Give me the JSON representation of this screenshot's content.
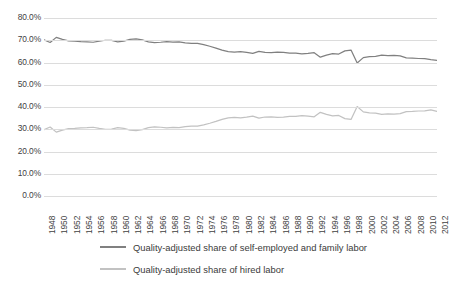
{
  "chart_data": {
    "type": "line",
    "title": "",
    "subtitle": "",
    "xlabel": "",
    "ylabel": "",
    "ylim": [
      0,
      0.8
    ],
    "ytick_labels": [
      "80.0%",
      "70.0%",
      "60.0%",
      "50.0%",
      "40.0%",
      "30.0%",
      "20.0%",
      "10.0%",
      "0.0%"
    ],
    "ytick_values": [
      80,
      70,
      60,
      50,
      40,
      30,
      20,
      10,
      0
    ],
    "grid": true,
    "legend_position": "bottom",
    "x": [
      1948,
      1949,
      1950,
      1951,
      1952,
      1953,
      1954,
      1955,
      1956,
      1957,
      1958,
      1959,
      1960,
      1961,
      1962,
      1963,
      1964,
      1965,
      1966,
      1967,
      1968,
      1969,
      1970,
      1971,
      1972,
      1973,
      1974,
      1975,
      1976,
      1977,
      1978,
      1979,
      1980,
      1981,
      1982,
      1983,
      1984,
      1985,
      1986,
      1987,
      1988,
      1989,
      1990,
      1991,
      1992,
      1993,
      1994,
      1995,
      1996,
      1997,
      1998,
      1999,
      2000,
      2001,
      2002,
      2003,
      2004,
      2005,
      2006,
      2007,
      2008,
      2009,
      2010,
      2011,
      2012
    ],
    "xtick_labels": [
      "1948",
      "1950",
      "1952",
      "1954",
      "1956",
      "1958",
      "1960",
      "1962",
      "1964",
      "1966",
      "1968",
      "1970",
      "1972",
      "1974",
      "1976",
      "1978",
      "1980",
      "1982",
      "1984",
      "1986",
      "1988",
      "1990",
      "1992",
      "1994",
      "1996",
      "1998",
      "2000",
      "2002",
      "2004",
      "2006",
      "2008",
      "2010",
      "2012"
    ],
    "series": [
      {
        "name": "Quality-adjusted share of self-employed and family labor",
        "color": "#808080",
        "values": [
          70.2,
          69.0,
          71.3,
          70.4,
          69.7,
          69.6,
          69.4,
          69.3,
          69.1,
          69.6,
          70.0,
          69.9,
          69.3,
          69.6,
          70.4,
          70.6,
          70.2,
          69.3,
          68.9,
          69.1,
          69.4,
          69.2,
          69.3,
          68.8,
          68.6,
          68.6,
          68.0,
          67.3,
          66.5,
          65.6,
          64.9,
          64.7,
          64.9,
          64.6,
          64.1,
          65.0,
          64.5,
          64.4,
          64.7,
          64.6,
          64.2,
          64.2,
          63.9,
          64.1,
          64.4,
          62.4,
          63.3,
          64.0,
          63.8,
          65.2,
          65.6,
          59.8,
          62.2,
          62.6,
          62.8,
          63.3,
          63.1,
          63.2,
          63.0,
          62.1,
          62.0,
          61.8,
          61.7,
          61.3,
          61.0
        ]
      },
      {
        "name": "Quality-adjusted share of hired labor",
        "color": "#c2c2c2",
        "values": [
          29.8,
          31.0,
          28.7,
          29.6,
          30.3,
          30.4,
          30.6,
          30.7,
          30.9,
          30.4,
          30.0,
          30.1,
          30.7,
          30.4,
          29.6,
          29.4,
          29.8,
          30.7,
          31.1,
          30.9,
          30.6,
          30.8,
          30.7,
          31.2,
          31.4,
          31.4,
          32.0,
          32.7,
          33.5,
          34.4,
          35.1,
          35.3,
          35.1,
          35.4,
          35.9,
          35.0,
          35.5,
          35.6,
          35.3,
          35.4,
          35.8,
          35.8,
          36.1,
          35.9,
          35.6,
          37.6,
          36.7,
          36.0,
          36.2,
          34.8,
          34.4,
          40.2,
          37.8,
          37.4,
          37.2,
          36.7,
          36.9,
          36.8,
          37.0,
          37.9,
          38.0,
          38.2,
          38.3,
          38.7,
          38.0
        ]
      }
    ]
  },
  "legend": {
    "items": [
      {
        "label": "Quality-adjusted share of self-employed and family labor",
        "color": "#808080"
      },
      {
        "label": "Quality-adjusted share of hired labor",
        "color": "#c2c2c2"
      }
    ]
  }
}
